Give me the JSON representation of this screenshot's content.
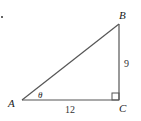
{
  "diagram": {
    "type": "right-triangle",
    "vertices": {
      "A": {
        "label": "A"
      },
      "B": {
        "label": "B"
      },
      "C": {
        "label": "C"
      }
    },
    "angle_label": "θ",
    "sides": {
      "BC": {
        "label": "9"
      },
      "AC": {
        "label": "12"
      }
    },
    "right_angle_at": "C",
    "colors": {
      "stroke": "#555555",
      "text": "#222222"
    }
  }
}
